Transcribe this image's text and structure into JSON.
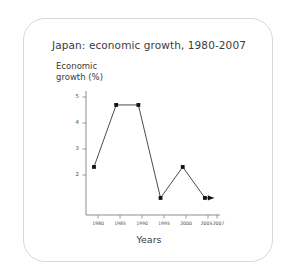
{
  "chart_data": {
    "type": "line",
    "title": "Japan: economic growth, 1980-2007",
    "xlabel": "Years",
    "ylabel": "Economic growth (%)",
    "ylabel_lines": [
      "Economic",
      "growth (%)"
    ],
    "categories": [
      "1980",
      "1985",
      "1990",
      "1995",
      "2000",
      "2005",
      "2007"
    ],
    "values": [
      3,
      5,
      5,
      2,
      3,
      2,
      2
    ],
    "x": [
      1980,
      1985,
      1990,
      1995,
      2000,
      2005,
      2007
    ],
    "xtick_labels": [
      "1980",
      "1985",
      "1990",
      "1995",
      "2000",
      "2005",
      "2007"
    ],
    "ytick_labels": [
      "5",
      "4",
      "3",
      "2"
    ],
    "ytick_values": [
      5,
      4,
      3,
      2
    ],
    "ylim": [
      1.45,
      5.45
    ],
    "xlim": [
      1978.2,
      2008.4
    ],
    "grid": false,
    "legend": null,
    "marker": "square",
    "line_end": "arrow",
    "series_color": "#111111",
    "axis_color": "#8d8d8d",
    "text_color": "#3b3b3b",
    "border_color": "#d9d9d9",
    "background": "#ffffff"
  },
  "figure": {
    "title": "Japan: economic growth, 1980-2007",
    "x_axis_title": "Years",
    "y_axis_title_line1": "Economic",
    "y_axis_title_line2": "growth (%)"
  }
}
